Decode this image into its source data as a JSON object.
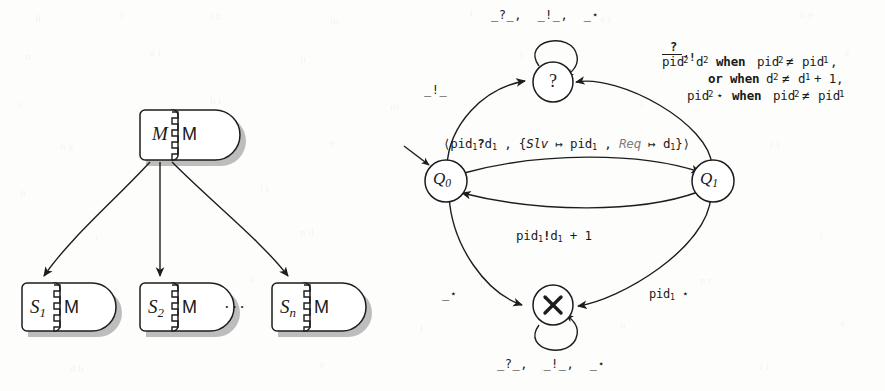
{
  "figure": {
    "ink_color": "#1d1d1d",
    "shadow_color": "#b9b9b9",
    "paper_color": "#fdfdfc"
  },
  "left_diagram": {
    "name": "component-hierarchy",
    "root": {
      "inner_label": "M",
      "port_label": "M"
    },
    "children": [
      {
        "inner_label": "S",
        "subscript": "1",
        "port_label": "M"
      },
      {
        "inner_label": "S",
        "subscript": "2",
        "port_label": "M"
      },
      {
        "inner_label": "S",
        "subscript": "n",
        "port_label": "M"
      }
    ],
    "ellipsis": "···",
    "edges": [
      {
        "from": "root",
        "to": "S1",
        "style": "curved-arrow"
      },
      {
        "from": "root",
        "to": "S2",
        "style": "straight-arrow"
      },
      {
        "from": "root",
        "to": "Sn",
        "style": "curved-arrow"
      }
    ]
  },
  "right_diagram": {
    "name": "protocol-automaton",
    "states": [
      {
        "id": "q_question",
        "label": "?",
        "kind": "circle"
      },
      {
        "id": "q0",
        "label": "Q",
        "subscript": "0",
        "kind": "circle"
      },
      {
        "id": "q1",
        "label": "Q",
        "subscript": "1",
        "kind": "circle"
      },
      {
        "id": "q_cross",
        "label": "✘",
        "kind": "circle"
      }
    ],
    "initial_marker": "incoming-arrow-into-Q0",
    "labels": {
      "top_selfloop": "_?_ ,  _!_ ,  _⋆",
      "bottom_selfloop": "_?_ ,  _!_ ,  _⋆",
      "q0_to_question": "_!_",
      "q0_to_cross": "_⋆",
      "q1_to_cross": "pid₁ ⋆",
      "q0_to_q1": "⟨pid₁?d₁ , {Slv ↦ pid₁ , Req ↦ d₁}⟩",
      "q1_to_q0": "pid₁!d₁ + 1",
      "q1_to_question_line1": "pid₂ ?/! d₂  when pid₂ ≠ pid₁ ,",
      "q1_to_question_line2": "or when d₂ ≠ d₁ + 1 ,",
      "q1_to_question_line3": "pid₂ ⋆  when pid₂ ≠ pid₁"
    },
    "label_parts": {
      "q0_to_q1": {
        "open": "⟨",
        "action": "pid",
        "action_sub": "1",
        "recv": "?",
        "datum": "d",
        "datum_sub": "1",
        "comma": " , ",
        "brace_open": "{",
        "map1_key": "Slv",
        "mapsto": " ↦ ",
        "map1_val": "pid",
        "map1_val_sub": "1",
        "map2_key": "Req",
        "map2_val": "d",
        "map2_val_sub": "1",
        "brace_close": "}",
        "close": "⟩"
      },
      "q1_to_q0": {
        "chan": "pid",
        "chan_sub": "1",
        "send": "!",
        "datum": "d",
        "datum_sub": "1",
        "plus": " + 1"
      },
      "q1_to_cross": {
        "chan": "pid",
        "chan_sub": "1",
        "star": "⋆"
      },
      "guard": {
        "over_recv": "?",
        "under_send": "!",
        "chan": "pid",
        "chan_sub": "2",
        "datum": "d",
        "datum_sub": "2",
        "tail_comma": ",",
        "l1_when": "when",
        "l1_lhs": "pid",
        "l1_lhs_sub": "2",
        "l1_neq": "≠",
        "l1_rhs": "pid",
        "l1_rhs_sub": "1",
        "l2_or_when": "or when",
        "l2_lhs": "d",
        "l2_lhs_sub": "2",
        "l2_neq": "≠",
        "l2_rhs": "d",
        "l2_rhs_sub": "1",
        "l2_plus": "+ 1",
        "l3_chan": "pid",
        "l3_chan_sub": "2",
        "l3_star": "⋆",
        "l3_when": "when",
        "l3_lhs": "pid",
        "l3_lhs_sub": "2",
        "l3_neq": "≠",
        "l3_rhs": "pid",
        "l3_rhs_sub": "1"
      },
      "selfloop_sig": {
        "a": "_?_",
        "sep1": ",",
        "b": "_!_",
        "sep2": ",",
        "c": "_⋆"
      },
      "simple": {
        "bang": "_!_",
        "star": "_⋆"
      }
    }
  }
}
